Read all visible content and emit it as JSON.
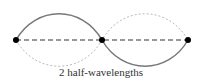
{
  "diagram": {
    "caption": "2 half-wavelengths",
    "nodes": [
      {
        "x": 16,
        "y": 40
      },
      {
        "x": 102,
        "y": 40
      },
      {
        "x": 188,
        "y": 40
      }
    ],
    "colors": {
      "solid_wave": "#777777",
      "dotted_wave": "#bbbbbb",
      "axis": "#333333",
      "node": "#000000"
    }
  }
}
